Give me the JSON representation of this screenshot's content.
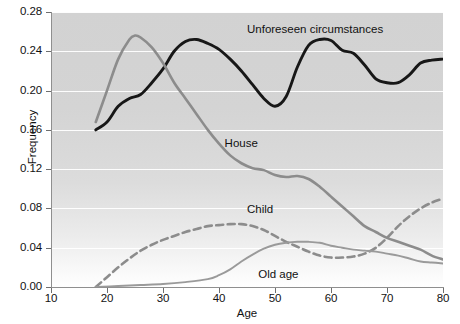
{
  "chart_data": {
    "type": "line",
    "title": "",
    "xlabel": "Age",
    "ylabel": "Frequency",
    "xlim": [
      10,
      80
    ],
    "ylim": [
      0.0,
      0.28
    ],
    "xticks": [
      "10",
      "20",
      "30",
      "40",
      "50",
      "60",
      "70",
      "80"
    ],
    "yticks": [
      "0.00",
      "0.04",
      "0.08",
      "0.12",
      "0.16",
      "0.20",
      "0.24",
      "0.28"
    ],
    "grid": "horizontal",
    "legend_position": "inline-annotations",
    "series": [
      {
        "name": "Unforeseen circumstances",
        "color": "#171717",
        "style": "solid",
        "width": 2.9,
        "label_x": 45,
        "label_y": 0.262,
        "x": [
          18,
          20,
          22,
          24,
          26,
          28,
          30,
          32,
          34,
          36,
          38,
          40,
          42,
          44,
          46,
          48,
          50,
          52,
          54,
          56,
          58,
          60,
          62,
          64,
          66,
          68,
          70,
          72,
          74,
          76,
          78,
          80
        ],
        "y": [
          0.16,
          0.168,
          0.184,
          0.192,
          0.196,
          0.208,
          0.222,
          0.24,
          0.25,
          0.252,
          0.248,
          0.242,
          0.232,
          0.22,
          0.206,
          0.192,
          0.184,
          0.194,
          0.224,
          0.246,
          0.252,
          0.251,
          0.241,
          0.238,
          0.226,
          0.212,
          0.208,
          0.208,
          0.216,
          0.228,
          0.231,
          0.232
        ]
      },
      {
        "name": "House",
        "color": "#8c8c8c",
        "style": "solid",
        "width": 2.6,
        "label_x": 41,
        "label_y": 0.146,
        "x": [
          18,
          20,
          22,
          24,
          25,
          26,
          28,
          30,
          32,
          34,
          36,
          38,
          40,
          42,
          44,
          46,
          48,
          50,
          52,
          54,
          56,
          58,
          60,
          62,
          64,
          66,
          68,
          70,
          72,
          74,
          76,
          78,
          80
        ],
        "y": [
          0.168,
          0.2,
          0.232,
          0.252,
          0.256,
          0.254,
          0.244,
          0.228,
          0.208,
          0.192,
          0.176,
          0.16,
          0.146,
          0.134,
          0.126,
          0.121,
          0.119,
          0.114,
          0.112,
          0.113,
          0.11,
          0.102,
          0.092,
          0.082,
          0.072,
          0.062,
          0.056,
          0.05,
          0.046,
          0.042,
          0.038,
          0.032,
          0.028
        ]
      },
      {
        "name": "Child",
        "color": "#8c8c8c",
        "style": "dashed",
        "width": 2.6,
        "label_x": 45,
        "label_y": 0.078,
        "x": [
          18,
          20,
          22,
          24,
          26,
          28,
          30,
          32,
          34,
          36,
          38,
          40,
          42,
          44,
          46,
          48,
          50,
          52,
          54,
          56,
          58,
          60,
          62,
          64,
          66,
          68,
          70,
          72,
          74,
          76,
          78,
          80
        ],
        "y": [
          0.0,
          0.01,
          0.02,
          0.029,
          0.037,
          0.043,
          0.048,
          0.052,
          0.056,
          0.059,
          0.062,
          0.063,
          0.064,
          0.064,
          0.062,
          0.058,
          0.052,
          0.046,
          0.041,
          0.036,
          0.032,
          0.03,
          0.03,
          0.031,
          0.034,
          0.04,
          0.05,
          0.062,
          0.072,
          0.08,
          0.086,
          0.09
        ]
      },
      {
        "name": "Old age",
        "color": "#9a9a9a",
        "style": "solid",
        "width": 1.9,
        "label_x": 47,
        "label_y": 0.012,
        "x": [
          18,
          22,
          26,
          30,
          34,
          38,
          40,
          42,
          44,
          46,
          48,
          50,
          52,
          54,
          56,
          58,
          60,
          62,
          64,
          66,
          68,
          70,
          72,
          74,
          76,
          78,
          80
        ],
        "y": [
          0.0,
          0.001,
          0.002,
          0.003,
          0.005,
          0.008,
          0.012,
          0.018,
          0.026,
          0.033,
          0.039,
          0.043,
          0.045,
          0.046,
          0.046,
          0.045,
          0.042,
          0.04,
          0.038,
          0.037,
          0.036,
          0.034,
          0.032,
          0.029,
          0.026,
          0.025,
          0.024
        ]
      }
    ]
  }
}
